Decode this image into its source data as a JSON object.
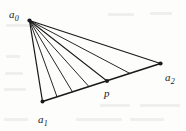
{
  "figure": {
    "kind": "geometry-diagram",
    "background_color": "#fdfdfc",
    "ink_color": "#1a1a1a",
    "width": 186,
    "height": 131,
    "labels": {
      "a0": {
        "base": "a",
        "sub": "0",
        "x": 9,
        "y": 5
      },
      "a1": {
        "base": "a",
        "sub": "1",
        "x": 38,
        "y": 110
      },
      "a2": {
        "base": "a",
        "sub": "2",
        "x": 165,
        "y": 68
      },
      "p": {
        "text": "p",
        "x": 104,
        "y": 88
      }
    },
    "vertices": {
      "a0": {
        "x": 29.5,
        "y": 20.5,
        "dot_radius": 2.1
      },
      "a1": {
        "x": 42.5,
        "y": 101.5,
        "dot_radius": 2.0
      },
      "a2": {
        "x": 160.5,
        "y": 63.5,
        "dot_radius": 2.1
      },
      "p": {
        "x": 107.0,
        "y": 81.0,
        "dot_radius": 2.0
      }
    },
    "edges": [
      {
        "name": "a0-a1",
        "from": [
          29.5,
          20.5
        ],
        "to": [
          42.5,
          101.5
        ],
        "width": 1.25
      },
      {
        "name": "a0-a2",
        "from": [
          29.5,
          20.5
        ],
        "to": [
          160.5,
          63.5
        ],
        "width": 1.25
      },
      {
        "name": "a1-a2",
        "from": [
          42.5,
          101.5
        ],
        "to": [
          160.5,
          63.5
        ],
        "width": 1.6
      }
    ],
    "fan_rays": [
      {
        "name": "ray-1",
        "from": [
          29.5,
          20.5
        ],
        "to": [
          57.0,
          96.8
        ],
        "width": 0.95
      },
      {
        "name": "ray-2",
        "from": [
          29.5,
          20.5
        ],
        "to": [
          72.5,
          91.9
        ],
        "width": 0.95
      },
      {
        "name": "ray-3",
        "from": [
          29.5,
          20.5
        ],
        "to": [
          89.0,
          86.6
        ],
        "width": 0.95
      },
      {
        "name": "ray-4",
        "from": [
          29.5,
          20.5
        ],
        "to": [
          107.0,
          81.0
        ],
        "width": 1.05
      },
      {
        "name": "ray-5",
        "from": [
          29.5,
          20.5
        ],
        "to": [
          130.0,
          73.5
        ],
        "width": 0.95
      }
    ],
    "ghost_marks": [
      {
        "x": 6,
        "y": 24,
        "w": 34,
        "h": 3
      },
      {
        "x": 108,
        "y": 13,
        "w": 26,
        "h": 3
      },
      {
        "x": 150,
        "y": 12,
        "w": 22,
        "h": 3
      },
      {
        "x": 6,
        "y": 55,
        "w": 14,
        "h": 3
      },
      {
        "x": 5,
        "y": 72,
        "w": 18,
        "h": 3
      },
      {
        "x": 4,
        "y": 88,
        "w": 22,
        "h": 3
      },
      {
        "x": 100,
        "y": 104,
        "w": 30,
        "h": 3
      },
      {
        "x": 140,
        "y": 104,
        "w": 40,
        "h": 3
      },
      {
        "x": 76,
        "y": 118,
        "w": 46,
        "h": 3
      },
      {
        "x": 130,
        "y": 118,
        "w": 34,
        "h": 3
      },
      {
        "x": 4,
        "y": 118,
        "w": 24,
        "h": 3
      }
    ]
  }
}
